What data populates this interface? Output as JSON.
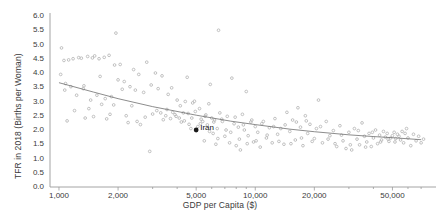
{
  "chart_data": {
    "type": "scatter",
    "title": "",
    "xlabel": "GDP per Capita ($)",
    "ylabel": "TFR in 2018 (Births per Woman)",
    "xscale": "log",
    "yscale": "linear",
    "xlim": [
      900,
      75000
    ],
    "ylim": [
      0.0,
      6.0
    ],
    "grid": false,
    "legend": null,
    "xticks": [
      1000,
      2000,
      5000,
      10000,
      20000,
      50000
    ],
    "xticklabels": [
      "1,000",
      "2,000",
      "5,000",
      "10,000",
      "20,000",
      "50,000"
    ],
    "yticks": [
      0.0,
      0.5,
      1.0,
      1.5,
      2.0,
      2.5,
      3.0,
      3.5,
      4.0,
      4.5,
      5.0,
      5.5,
      6.0
    ],
    "yticklabels": [
      "0.0",
      "0.5",
      "1.0",
      "1.5",
      "2.0",
      "2.5",
      "3.0",
      "3.5",
      "4.0",
      "4.5",
      "5.0",
      "5.5",
      "6.0"
    ],
    "marker_color": "#b6b6b6",
    "highlight_color": "#1a1a1a",
    "trendline_color": "#6e6e6e",
    "axis_color": "#9a9a9a",
    "annotations": [
      {
        "label": "Iran",
        "x": 5000,
        "y": 2.0
      }
    ],
    "trendline": {
      "note": "log-linear decreasing fit",
      "points": [
        [
          1000,
          3.66
        ],
        [
          1500,
          3.33
        ],
        [
          2000,
          3.1
        ],
        [
          3000,
          2.82
        ],
        [
          5000,
          2.52
        ],
        [
          7500,
          2.31
        ],
        [
          10000,
          2.19
        ],
        [
          15000,
          2.03
        ],
        [
          20000,
          1.94
        ],
        [
          30000,
          1.83
        ],
        [
          40000,
          1.77
        ],
        [
          50000,
          1.73
        ],
        [
          70000,
          1.66
        ]
      ]
    },
    "points": [
      [
        1030,
        4.88
      ],
      [
        1060,
        4.44
      ],
      [
        1080,
        3.63
      ],
      [
        1100,
        2.32
      ],
      [
        1150,
        3.52
      ],
      [
        1180,
        4.5
      ],
      [
        1200,
        2.68
      ],
      [
        1230,
        3.22
      ],
      [
        1260,
        4.54
      ],
      [
        1300,
        4.52
      ],
      [
        1330,
        3.45
      ],
      [
        1360,
        2.42
      ],
      [
        1400,
        4.58
      ],
      [
        1450,
        3.05
      ],
      [
        1480,
        4.53
      ],
      [
        1500,
        2.47
      ],
      [
        1560,
        3.22
      ],
      [
        1600,
        4.5
      ],
      [
        1650,
        2.9
      ],
      [
        1700,
        4.55
      ],
      [
        1750,
        2.39
      ],
      [
        1800,
        4.62
      ],
      [
        1850,
        3.17
      ],
      [
        1900,
        2.88
      ],
      [
        1950,
        5.4
      ],
      [
        2000,
        3.76
      ],
      [
        2050,
        4.3
      ],
      [
        2100,
        3.43
      ],
      [
        2200,
        2.5
      ],
      [
        2250,
        2.26
      ],
      [
        2300,
        3.52
      ],
      [
        2400,
        4.12
      ],
      [
        2450,
        3.4
      ],
      [
        2500,
        2.3
      ],
      [
        2600,
        2.19
      ],
      [
        2700,
        3.32
      ],
      [
        2800,
        4.38
      ],
      [
        2900,
        1.25
      ],
      [
        3000,
        2.56
      ],
      [
        3100,
        4.0
      ],
      [
        3200,
        3.45
      ],
      [
        3300,
        2.6
      ],
      [
        3400,
        2.36
      ],
      [
        3500,
        2.5
      ],
      [
        3600,
        3.25
      ],
      [
        3700,
        2.4
      ],
      [
        3800,
        2.62
      ],
      [
        3900,
        2.54
      ],
      [
        4000,
        3.05
      ],
      [
        4100,
        2.42
      ],
      [
        4200,
        2.28
      ],
      [
        4300,
        2.6
      ],
      [
        4400,
        3.0
      ],
      [
        4500,
        3.85
      ],
      [
        4600,
        2.2
      ],
      [
        4700,
        2.05
      ],
      [
        4800,
        2.95
      ],
      [
        4900,
        3.01
      ],
      [
        5000,
        2.0
      ],
      [
        5100,
        2.12
      ],
      [
        5200,
        2.75
      ],
      [
        5300,
        2.38
      ],
      [
        5400,
        2.3
      ],
      [
        5500,
        1.62
      ],
      [
        5600,
        2.53
      ],
      [
        5700,
        2.18
      ],
      [
        5800,
        2.92
      ],
      [
        5900,
        3.6
      ],
      [
        6000,
        2.42
      ],
      [
        6100,
        1.88
      ],
      [
        6200,
        2.35
      ],
      [
        6300,
        1.5
      ],
      [
        6400,
        2.05
      ],
      [
        6500,
        5.5
      ],
      [
        6600,
        2.6
      ],
      [
        6800,
        2.3
      ],
      [
        7000,
        1.78
      ],
      [
        7200,
        2.48
      ],
      [
        7400,
        1.55
      ],
      [
        7600,
        3.82
      ],
      [
        7800,
        2.22
      ],
      [
        8000,
        1.45
      ],
      [
        8200,
        2.1
      ],
      [
        8400,
        1.3
      ],
      [
        8600,
        2.55
      ],
      [
        8800,
        2.0
      ],
      [
        9000,
        3.35
      ],
      [
        9200,
        1.8
      ],
      [
        9500,
        2.28
      ],
      [
        9800,
        1.58
      ],
      [
        10000,
        2.12
      ],
      [
        10300,
        1.92
      ],
      [
        10600,
        1.4
      ],
      [
        11000,
        2.3
      ],
      [
        11400,
        1.72
      ],
      [
        11800,
        2.08
      ],
      [
        12200,
        1.55
      ],
      [
        12600,
        2.4
      ],
      [
        13000,
        1.85
      ],
      [
        13500,
        2.05
      ],
      [
        14000,
        1.5
      ],
      [
        14500,
        2.62
      ],
      [
        15000,
        1.95
      ],
      [
        15500,
        2.35
      ],
      [
        16000,
        1.65
      ],
      [
        16500,
        2.78
      ],
      [
        17000,
        2.1
      ],
      [
        17500,
        1.45
      ],
      [
        18000,
        2.5
      ],
      [
        18500,
        1.88
      ],
      [
        19000,
        2.2
      ],
      [
        20000,
        1.7
      ],
      [
        20500,
        2.05
      ],
      [
        21000,
        3.05
      ],
      [
        22000,
        1.55
      ],
      [
        23000,
        2.3
      ],
      [
        24000,
        1.8
      ],
      [
        25000,
        1.98
      ],
      [
        26000,
        1.42
      ],
      [
        27000,
        2.15
      ],
      [
        28000,
        1.62
      ],
      [
        29000,
        1.35
      ],
      [
        30000,
        1.92
      ],
      [
        31000,
        1.3
      ],
      [
        32000,
        2.05
      ],
      [
        33000,
        1.68
      ],
      [
        34000,
        1.48
      ],
      [
        35000,
        2.25
      ],
      [
        36000,
        1.78
      ],
      [
        37000,
        1.58
      ],
      [
        38000,
        1.88
      ],
      [
        39000,
        1.42
      ],
      [
        40000,
        1.72
      ],
      [
        41000,
        2.0
      ],
      [
        42000,
        1.52
      ],
      [
        43000,
        1.82
      ],
      [
        44000,
        1.65
      ],
      [
        45000,
        1.95
      ],
      [
        46000,
        1.75
      ],
      [
        47000,
        1.88
      ],
      [
        48000,
        1.6
      ],
      [
        49000,
        1.72
      ],
      [
        50000,
        1.8
      ],
      [
        51000,
        1.92
      ],
      [
        52000,
        1.7
      ],
      [
        53000,
        1.85
      ],
      [
        54000,
        1.78
      ],
      [
        55000,
        1.65
      ],
      [
        56000,
        1.95
      ],
      [
        57000,
        1.55
      ],
      [
        58000,
        1.88
      ],
      [
        59000,
        2.05
      ],
      [
        60000,
        1.72
      ],
      [
        62000,
        1.45
      ],
      [
        64000,
        1.85
      ],
      [
        66000,
        1.62
      ],
      [
        68000,
        1.78
      ],
      [
        70000,
        1.55
      ],
      [
        72000,
        1.68
      ],
      [
        1020,
        3.95
      ],
      [
        1070,
        3.4
      ],
      [
        1120,
        4.46
      ],
      [
        1340,
        3.55
      ],
      [
        1420,
        2.75
      ],
      [
        1520,
        4.6
      ],
      [
        1620,
        3.88
      ],
      [
        1720,
        3.1
      ],
      [
        1820,
        2.55
      ],
      [
        1920,
        4.28
      ],
      [
        2150,
        3.7
      ],
      [
        2350,
        2.85
      ],
      [
        2550,
        3.95
      ],
      [
        2750,
        2.45
      ],
      [
        2950,
        3.58
      ],
      [
        3150,
        2.68
      ],
      [
        3350,
        3.9
      ],
      [
        3550,
        2.72
      ],
      [
        3750,
        3.48
      ],
      [
        3950,
        2.48
      ],
      [
        4150,
        2.85
      ],
      [
        4350,
        2.32
      ],
      [
        4550,
        2.58
      ],
      [
        4750,
        2.42
      ],
      [
        4950,
        2.65
      ],
      [
        5250,
        2.22
      ],
      [
        5550,
        2.48
      ],
      [
        5850,
        1.95
      ],
      [
        6150,
        2.28
      ],
      [
        6450,
        1.7
      ],
      [
        6750,
        2.38
      ],
      [
        7100,
        2.0
      ],
      [
        7500,
        1.92
      ],
      [
        7900,
        2.45
      ],
      [
        8300,
        1.68
      ],
      [
        8700,
        2.18
      ],
      [
        9100,
        1.52
      ],
      [
        9600,
        2.35
      ],
      [
        10100,
        1.62
      ],
      [
        10800,
        2.22
      ],
      [
        11500,
        1.82
      ],
      [
        12400,
        2.12
      ],
      [
        13200,
        1.6
      ],
      [
        14200,
        2.18
      ],
      [
        15200,
        1.52
      ],
      [
        16200,
        2.28
      ],
      [
        17200,
        1.72
      ],
      [
        18200,
        2.32
      ],
      [
        19500,
        1.6
      ],
      [
        21500,
        2.12
      ],
      [
        23500,
        1.68
      ],
      [
        25500,
        1.52
      ],
      [
        27500,
        1.82
      ],
      [
        30500,
        1.48
      ],
      [
        33500,
        1.98
      ],
      [
        36500,
        1.4
      ],
      [
        39500,
        1.92
      ],
      [
        43500,
        1.58
      ],
      [
        47500,
        1.68
      ],
      [
        51500,
        1.58
      ]
    ]
  }
}
